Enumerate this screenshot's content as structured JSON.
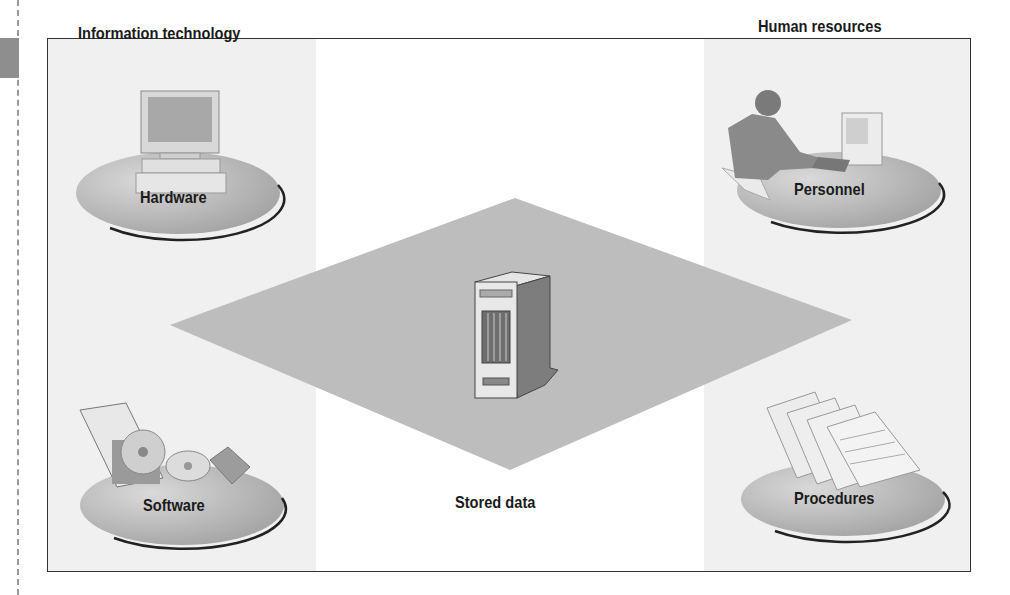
{
  "diagram": {
    "groups": [
      {
        "id": "it",
        "title": "Information technology"
      },
      {
        "id": "hr",
        "title": "Human resources"
      }
    ],
    "components": [
      {
        "id": "hardware",
        "label": "Hardware",
        "group": "it",
        "icon": "desktop-computer-icon"
      },
      {
        "id": "software",
        "label": "Software",
        "group": "it",
        "icon": "software-discs-icon"
      },
      {
        "id": "personnel",
        "label": "Personnel",
        "group": "hr",
        "icon": "person-at-computer-icon"
      },
      {
        "id": "procedures",
        "label": "Procedures",
        "group": "hr",
        "icon": "procedure-documents-icon"
      },
      {
        "id": "stored_data",
        "label": "Stored data",
        "group": null,
        "icon": "server-tower-icon"
      }
    ],
    "colors": {
      "panel_bg": "#f0f0f0",
      "platform": "#bdbdbd",
      "disc": "#b8b8b8",
      "frame": "#333333",
      "text": "#1a1a1a"
    }
  }
}
